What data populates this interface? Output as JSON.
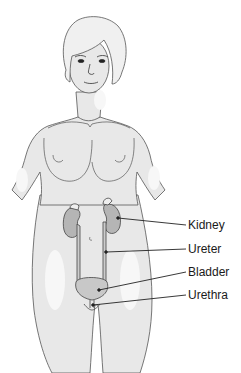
{
  "diagram": {
    "labels": [
      {
        "id": "kidney",
        "text": "Kidney",
        "x": 188,
        "y": 217
      },
      {
        "id": "ureter",
        "text": "Ureter",
        "x": 188,
        "y": 240
      },
      {
        "id": "bladder",
        "text": "Bladder",
        "x": 188,
        "y": 263
      },
      {
        "id": "urethra",
        "text": "Urethra",
        "x": 188,
        "y": 286
      }
    ],
    "colors": {
      "skin": "#e8e8e8",
      "skin_highlight": "#f6f6f6",
      "outline": "#4a4a4a",
      "organ": "#b5b5b5",
      "organ_light": "#d4d4d4",
      "leader_line": "#222222",
      "text": "#1a1a1a"
    }
  }
}
